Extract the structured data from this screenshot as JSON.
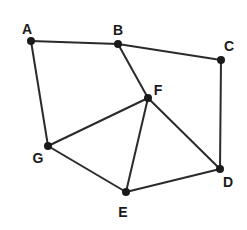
{
  "graph": {
    "nodes": [
      {
        "id": "A",
        "x": 31,
        "y": 41,
        "lx": 27,
        "ly": 30
      },
      {
        "id": "B",
        "x": 118,
        "y": 44,
        "lx": 118,
        "ly": 31
      },
      {
        "id": "C",
        "x": 221,
        "y": 60,
        "lx": 229,
        "ly": 47
      },
      {
        "id": "F",
        "x": 148,
        "y": 98,
        "lx": 158,
        "ly": 91
      },
      {
        "id": "G",
        "x": 48,
        "y": 146,
        "lx": 38,
        "ly": 159
      },
      {
        "id": "D",
        "x": 220,
        "y": 169,
        "lx": 228,
        "ly": 183
      },
      {
        "id": "E",
        "x": 126,
        "y": 192,
        "lx": 123,
        "ly": 213
      }
    ],
    "edges": [
      [
        "A",
        "B"
      ],
      [
        "B",
        "C"
      ],
      [
        "A",
        "G"
      ],
      [
        "B",
        "F"
      ],
      [
        "C",
        "D"
      ],
      [
        "F",
        "G"
      ],
      [
        "F",
        "E"
      ],
      [
        "F",
        "D"
      ],
      [
        "G",
        "E"
      ],
      [
        "E",
        "D"
      ]
    ]
  }
}
